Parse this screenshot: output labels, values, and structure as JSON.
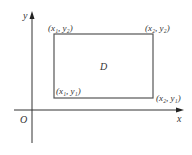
{
  "diagram": {
    "axes": {
      "x_label": "x",
      "y_label": "y",
      "origin_label": "O"
    },
    "region": {
      "label": "D",
      "corners": {
        "top_left": "(x₁, y₂)",
        "top_right": "(x₂, y₂)",
        "bottom_left": "(x₁, y₁)",
        "bottom_right": "(x₂, y₁)"
      }
    },
    "colors": {
      "line": "#444444",
      "background": "#ffffff"
    }
  }
}
